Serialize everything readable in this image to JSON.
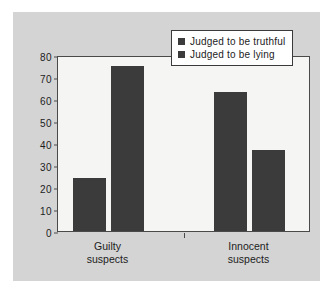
{
  "chart_data": {
    "type": "bar",
    "title": "",
    "xlabel": "",
    "ylabel": "",
    "categories": [
      "Guilty suspects",
      "Innocent suspects"
    ],
    "category_lines": [
      [
        "Guilty",
        "suspects"
      ],
      [
        "Innocent",
        "suspects"
      ]
    ],
    "series": [
      {
        "name": "Judged to be truthful",
        "values": [
          24,
          63
        ],
        "color": "#3b3b3b"
      },
      {
        "name": "Judged to be lying",
        "values": [
          75,
          37
        ],
        "color": "#3b3b3b"
      }
    ],
    "ylim": [
      0,
      80
    ],
    "yticks": [
      0,
      10,
      20,
      30,
      40,
      50,
      60,
      70,
      80
    ],
    "ytick_labels": [
      "0",
      "10",
      "20",
      "30",
      "40",
      "50",
      "60",
      "70",
      "80"
    ],
    "grid": false,
    "legend_position": "top-right"
  },
  "legend": {
    "entries": [
      {
        "label": "Judged to be truthful"
      },
      {
        "label": "Judged to be lying"
      }
    ]
  },
  "colors": {
    "bar": "#3b3b3b",
    "panel_background": "#d4d4d4",
    "plot_background": "#f5f5f3",
    "axis": "#4a4a4a",
    "text": "#1c1c1c",
    "legend_background": "#ffffff"
  }
}
